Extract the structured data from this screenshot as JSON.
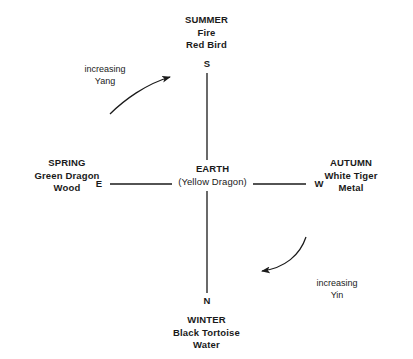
{
  "diagram": {
    "background_color": "#ffffff",
    "line_color": "#1a1a1a",
    "text_color": "#1a1a1a",
    "center": {
      "title": "EARTH",
      "subtitle": "(Yellow Dragon)"
    },
    "directions": {
      "top": "S",
      "bottom": "N",
      "left": "E",
      "right": "W"
    },
    "quadrants": {
      "top": {
        "season": "SUMMER",
        "element": "Fire",
        "animal": "Red Bird"
      },
      "bottom": {
        "season": "WINTER",
        "element": "Black Tortoise",
        "animal": "Water"
      },
      "left": {
        "season": "SPRING",
        "element": "Green Dragon",
        "animal": "Wood"
      },
      "right": {
        "season": "AUTUMN",
        "element": "White Tiger",
        "animal": "Metal"
      }
    },
    "flows": {
      "yang": {
        "line1": "increasing",
        "line2": "Yang"
      },
      "yin": {
        "line1": "increasing",
        "line2": "Yin"
      }
    }
  }
}
